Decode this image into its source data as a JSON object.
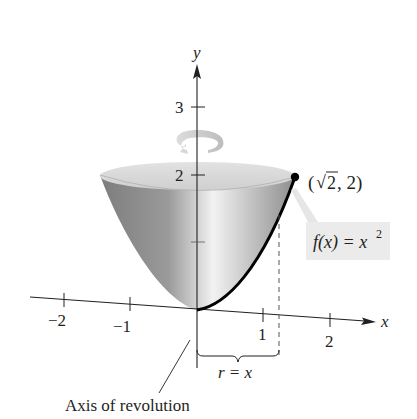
{
  "diagram": {
    "type": "solid-of-revolution",
    "axes": {
      "x_label": "x",
      "y_label": "y",
      "x_ticks": [
        "−2",
        "−1",
        "1",
        "2"
      ],
      "y_ticks": [
        "3",
        "2"
      ]
    },
    "point_label": "(√2, 2)",
    "point_label_parts": {
      "open": "(",
      "sqrt": "√",
      "radicand": "2",
      "rest": ", 2)"
    },
    "function_label": {
      "lhs": "f(x) = x",
      "exponent": "2"
    },
    "radius_label": "r = x",
    "axis_label": "Axis of revolution",
    "colors": {
      "axis": "#231f20",
      "surface_light": "#e6e6e6",
      "surface_dark": "#8a8a8a",
      "rim": "#d4d4d4",
      "rotation_arrow": "#c8c8c8",
      "label_box": "#ebebeb"
    }
  }
}
